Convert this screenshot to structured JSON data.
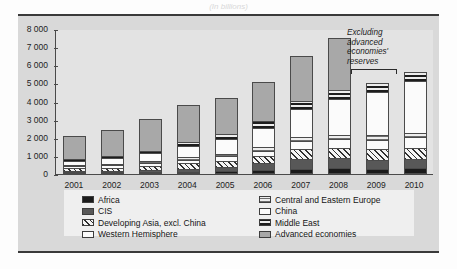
{
  "figure": {
    "title_partial": "(In billions)",
    "annotation": {
      "line1": "Excluding",
      "line2": "advanced",
      "line3": "economies'",
      "line4": "reserves"
    }
  },
  "legend": {
    "left": [
      {
        "label": "Africa",
        "swatch": "solid-black-swatch",
        "key": "africa"
      },
      {
        "label": "CIS",
        "swatch": "solid-dark-gray-swatch",
        "key": "cis"
      },
      {
        "label": "Developing Asia, excl. China",
        "swatch": "diagonal-hatch-swatch",
        "key": "asia"
      },
      {
        "label": "Western Hemisphere",
        "swatch": "white-outline-swatch",
        "key": "wh"
      }
    ],
    "right": [
      {
        "label": "Central and Eastern Europe",
        "swatch": "horizontal-stripe-light-swatch",
        "key": "cee"
      },
      {
        "label": "China",
        "swatch": "white-outline-swatch",
        "key": "china"
      },
      {
        "label": "Middle East",
        "swatch": "horizontal-band-dark-swatch",
        "key": "me"
      },
      {
        "label": "Advanced economies",
        "swatch": "solid-medium-gray-swatch",
        "key": "adv"
      }
    ]
  },
  "chart_data": {
    "type": "bar",
    "title": "(In billions)",
    "xlabel": "",
    "ylabel": "",
    "ylim": [
      0,
      8000
    ],
    "yticks": [
      "0",
      "1 000",
      "2 000",
      "3 000",
      "4 000",
      "5 000",
      "6 000",
      "7 000",
      "8 000"
    ],
    "ytick_values": [
      0,
      1000,
      2000,
      3000,
      4000,
      5000,
      6000,
      7000,
      8000
    ],
    "grid": false,
    "stacked": true,
    "legend_position": "bottom",
    "categories": [
      "2001",
      "2002",
      "2003",
      "2004",
      "2005",
      "2006",
      "2007",
      "2008",
      "2009",
      "2010"
    ],
    "series": [
      {
        "name": "Africa",
        "key": "africa",
        "values": [
          60,
          75,
          95,
          130,
          170,
          230,
          290,
          330,
          300,
          310
        ]
      },
      {
        "name": "CIS",
        "key": "cis",
        "values": [
          45,
          65,
          110,
          170,
          230,
          360,
          560,
          540,
          480,
          510
        ]
      },
      {
        "name": "Developing Asia, excl. China",
        "key": "asia",
        "values": [
          150,
          180,
          230,
          290,
          330,
          400,
          520,
          560,
          600,
          640
        ]
      },
      {
        "name": "Western Hemisphere",
        "key": "wh",
        "values": [
          130,
          140,
          170,
          200,
          240,
          300,
          430,
          490,
          520,
          570
        ]
      },
      {
        "name": "Central and Eastern Europe",
        "key": "cee",
        "values": [
          70,
          85,
          110,
          140,
          160,
          190,
          250,
          250,
          240,
          250
        ]
      },
      {
        "name": "China",
        "key": "china",
        "values": [
          215,
          290,
          410,
          615,
          820,
          1070,
          1530,
          1950,
          2400,
          2850
        ]
      },
      {
        "name": "Middle East",
        "key": "me",
        "values": [
          110,
          125,
          155,
          200,
          270,
          350,
          450,
          520,
          480,
          500
        ]
      },
      {
        "name": "Advanced economies",
        "key": "adv",
        "values": [
          1270,
          1460,
          1770,
          2050,
          1980,
          2200,
          2470,
          2860,
          0,
          0
        ]
      }
    ],
    "totals": [
      2050,
      2420,
      3050,
      3795,
      4200,
      5100,
      6500,
      7500,
      5020,
      5630
    ],
    "annotation": {
      "text": "Excluding advanced economies' reserves",
      "applies_to": [
        "2009",
        "2010"
      ]
    }
  }
}
